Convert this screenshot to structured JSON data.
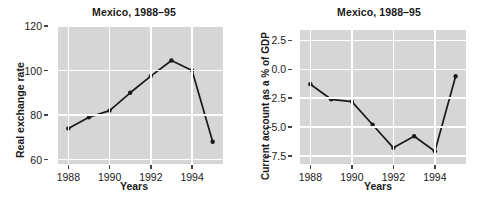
{
  "figure": {
    "panels": [
      {
        "id": "real-exchange-rate",
        "title": "Mexico, 1988–95",
        "ylabel": "Real exchange rate",
        "xlabel": "Years"
      },
      {
        "id": "current-account",
        "title": "Mexico, 1988–95",
        "ylabel": "Current account as a % of GDP",
        "xlabel": "Years"
      }
    ],
    "style": {
      "plot_background": "#d6d6d6",
      "gridline_color": "#ffffff",
      "series_color": "#1a1a1a",
      "text_color": "#1a1a1a",
      "page_background": "#ffffff"
    }
  },
  "chart_data": [
    {
      "type": "line",
      "title": "Mexico, 1988–95",
      "xlabel": "Years",
      "ylabel": "Real exchange rate",
      "x": [
        1988,
        1989,
        1990,
        1991,
        1992,
        1993,
        1994,
        1995
      ],
      "values": [
        74,
        79,
        82,
        90,
        97.5,
        104.5,
        100,
        68
      ],
      "xlim": [
        1987.5,
        1995.5
      ],
      "ylim": [
        58,
        120
      ],
      "xticks": [
        1988,
        1990,
        1992,
        1994
      ],
      "xtick_labels": [
        "1988",
        "1990",
        "1992",
        "1994"
      ],
      "yticks": [
        60,
        80,
        100,
        120
      ],
      "ytick_labels": [
        "60",
        "80",
        "100",
        "120"
      ],
      "grid": true,
      "legend": "none",
      "markers": "filled-circle"
    },
    {
      "type": "line",
      "title": "Mexico, 1988–95",
      "xlabel": "Years",
      "ylabel": "Current account as a % of GDP",
      "x": [
        1988,
        1989,
        1990,
        1991,
        1992,
        1993,
        1994,
        1995
      ],
      "values": [
        -1.3,
        -2.6,
        -2.8,
        -4.8,
        -6.8,
        -5.8,
        -7.1,
        -0.6
      ],
      "xlim": [
        1987.5,
        1995.5
      ],
      "ylim": [
        -8.2,
        3.4
      ],
      "xticks": [
        1988,
        1990,
        1992,
        1994
      ],
      "xtick_labels": [
        "1988",
        "1990",
        "1992",
        "1994"
      ],
      "yticks": [
        2.5,
        0.0,
        -2.5,
        -5.0,
        -7.5
      ],
      "ytick_labels": [
        "2.5",
        "0.0",
        "−2.5",
        "−5.0",
        "−7.5"
      ],
      "grid": true,
      "legend": "none",
      "markers": "filled-circle"
    }
  ]
}
